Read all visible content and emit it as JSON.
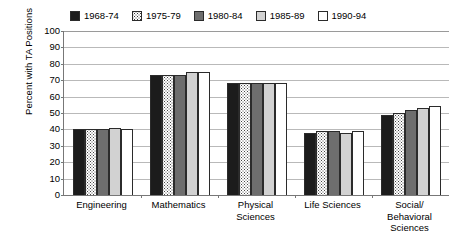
{
  "chart_data": {
    "type": "bar",
    "title": "",
    "xlabel": "",
    "ylabel": "Percent with TA Positions",
    "ylim": [
      0,
      100
    ],
    "ytick_step": 10,
    "yticks": [
      "100",
      "90",
      "80",
      "70",
      "60",
      "50",
      "40",
      "30",
      "20",
      "10",
      "0"
    ],
    "grid": true,
    "legend_position": "top",
    "categories": [
      "Engineering",
      "Mathematics",
      "Physical Sciences",
      "Life Sciences",
      "Social/ Behavioral Sciences"
    ],
    "category_lines": [
      [
        "Engineering"
      ],
      [
        "Mathematics"
      ],
      [
        "Physical",
        "Sciences"
      ],
      [
        "Life Sciences"
      ],
      [
        "Social/",
        "Behavioral",
        "Sciences"
      ]
    ],
    "series": [
      {
        "name": "1968-74",
        "color": "#1c1c1c",
        "pattern": "solid",
        "values": [
          40,
          73,
          68,
          38,
          49
        ]
      },
      {
        "name": "1975-79",
        "color": "#ffffff",
        "pattern": "dotted",
        "values": [
          40,
          73,
          68,
          39,
          50
        ]
      },
      {
        "name": "1980-84",
        "color": "#6e6e6e",
        "pattern": "solid",
        "values": [
          40,
          73,
          68,
          39,
          52
        ]
      },
      {
        "name": "1985-89",
        "color": "#d2d2d2",
        "pattern": "solid",
        "values": [
          41,
          75,
          68,
          38,
          53
        ]
      },
      {
        "name": "1990-94",
        "color": "#ffffff",
        "pattern": "solid",
        "values": [
          40,
          75,
          68,
          39,
          54
        ]
      }
    ]
  },
  "legend": {
    "items": [
      {
        "label": "1968-74",
        "swatch": "legend-swatch-solid-black"
      },
      {
        "label": "1975-79",
        "swatch": "legend-swatch-dotted"
      },
      {
        "label": "1980-84",
        "swatch": "legend-swatch-dark-gray"
      },
      {
        "label": "1985-89",
        "swatch": "legend-swatch-light-gray"
      },
      {
        "label": "1990-94",
        "swatch": "legend-swatch-white"
      }
    ]
  },
  "colors": {
    "series_1968_74": "#1c1c1c",
    "series_1975_79": "#ffffff",
    "series_1980_84": "#6e6e6e",
    "series_1985_89": "#d2d2d2",
    "series_1990_94": "#ffffff",
    "gridline": "#b9b9b9",
    "axis": "#777777",
    "background": "#ffffff"
  }
}
